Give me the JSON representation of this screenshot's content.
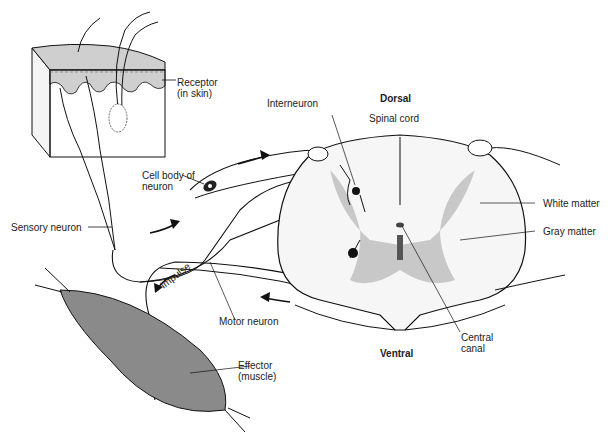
{
  "orientation": {
    "dorsal": "Dorsal",
    "ventral": "Ventral"
  },
  "labels": {
    "receptor_line1": "Receptor",
    "receptor_line2": "(in skin)",
    "interneuron": "Interneuron",
    "spinal_cord": "Spinal cord",
    "cell_body_line1": "Cell body of",
    "cell_body_line2": "neuron",
    "white_matter": "White matter",
    "gray_matter": "Gray matter",
    "sensory_neuron": "Sensory neuron",
    "impulse": "Impulse",
    "motor_neuron": "Motor neuron",
    "central_canal_line1": "Central",
    "central_canal_line2": "canal",
    "effector_line1": "Effector",
    "effector_line2": "(muscle)"
  },
  "colors": {
    "gray_matter": "#c8c8c8",
    "muscle": "#8a8a8a",
    "skin_epidermis": "#cfcfcf",
    "outline": "#111111"
  }
}
